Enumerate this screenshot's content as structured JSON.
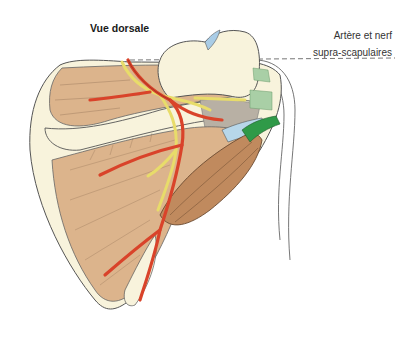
{
  "figure": {
    "title": "Vue dorsale",
    "labels": [
      {
        "line1": "Artère et nerf",
        "line2": "supra-scapulaires"
      }
    ],
    "structures": [
      "scapula",
      "acromion",
      "supraspinatus-muscle",
      "infraspinatus-muscle",
      "teres-minor-muscle",
      "suprascapular-artery",
      "suprascapular-nerve",
      "circumflex-scapular-artery",
      "joint-capsule",
      "rotator-cuff-tendons"
    ],
    "colors": {
      "bone": "#f8f3dc",
      "muscle": "#dcb48c",
      "muscle_dark": "#c08a5e",
      "artery": "#d9432a",
      "nerve": "#e8dc6a",
      "tendon_green": "#2f9a48",
      "tendon_light_green": "#a9cfa6",
      "capsule_blue": "#b7d7ea",
      "outline": "#555555",
      "dashed_line": "#777777"
    }
  }
}
